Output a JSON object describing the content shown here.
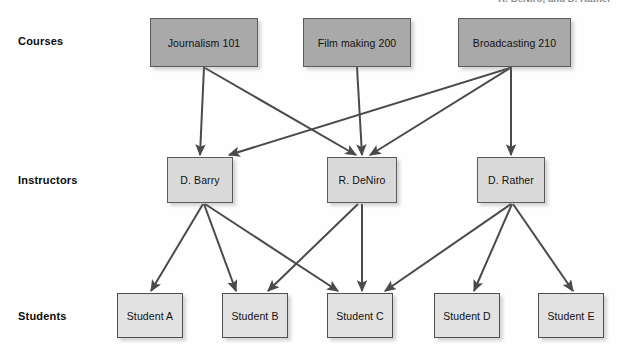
{
  "figure": {
    "top_caption": "R. DeNiro, and D. Rather",
    "type": "hierarchical-relationship-diagram",
    "background_color": "#fefefe",
    "edge_color": "#4a4a4a"
  },
  "rows": [
    {
      "label": "Courses",
      "y": 41,
      "color": "#a9a9a9"
    },
    {
      "label": "Instructors",
      "y": 180,
      "color": "#d9d9d9"
    },
    {
      "label": "Students",
      "y": 316,
      "color": "#e2e2e2"
    }
  ],
  "nodes": {
    "courses": [
      {
        "id": "journalism101",
        "label": "Journalism 101",
        "x": 150,
        "y": 18,
        "w": 108,
        "h": 49
      },
      {
        "id": "filmmaking200",
        "label": "Film making 200",
        "x": 303,
        "y": 18,
        "w": 108,
        "h": 49
      },
      {
        "id": "broadcasting210",
        "label": "Broadcasting 210",
        "x": 458,
        "y": 18,
        "w": 113,
        "h": 49
      }
    ],
    "instructors": [
      {
        "id": "dbarry",
        "label": "D. Barry",
        "x": 167,
        "y": 157,
        "w": 66,
        "h": 46
      },
      {
        "id": "rdeniro",
        "label": "R. DeNiro",
        "x": 327,
        "y": 157,
        "w": 70,
        "h": 46
      },
      {
        "id": "drather",
        "label": "D. Rather",
        "x": 477,
        "y": 157,
        "w": 68,
        "h": 46
      }
    ],
    "students": [
      {
        "id": "studentA",
        "label": "Student A",
        "x": 117,
        "y": 293,
        "w": 66,
        "h": 45
      },
      {
        "id": "studentB",
        "label": "Student B",
        "x": 222,
        "y": 293,
        "w": 66,
        "h": 45
      },
      {
        "id": "studentC",
        "label": "Student C",
        "x": 327,
        "y": 293,
        "w": 66,
        "h": 45
      },
      {
        "id": "studentD",
        "label": "Student D",
        "x": 434,
        "y": 293,
        "w": 66,
        "h": 45
      },
      {
        "id": "studentE",
        "label": "Student E",
        "x": 538,
        "y": 293,
        "w": 66,
        "h": 45
      }
    ]
  },
  "edges": [
    {
      "from": "journalism101",
      "to": "dbarry",
      "x1": 204,
      "y1": 67,
      "x2": 200,
      "y2": 155
    },
    {
      "from": "journalism101",
      "to": "rdeniro",
      "x1": 205,
      "y1": 68,
      "x2": 356,
      "y2": 155
    },
    {
      "from": "filmmaking200",
      "to": "rdeniro",
      "x1": 357,
      "y1": 67,
      "x2": 362,
      "y2": 155
    },
    {
      "from": "broadcasting210",
      "to": "dbarry",
      "x1": 510,
      "y1": 68,
      "x2": 229,
      "y2": 155
    },
    {
      "from": "broadcasting210",
      "to": "rdeniro",
      "x1": 510,
      "y1": 68,
      "x2": 370,
      "y2": 155
    },
    {
      "from": "broadcasting210",
      "to": "drather",
      "x1": 511,
      "y1": 67,
      "x2": 511,
      "y2": 155
    },
    {
      "from": "dbarry",
      "to": "studentA",
      "x1": 203,
      "y1": 204,
      "x2": 151,
      "y2": 291
    },
    {
      "from": "dbarry",
      "to": "studentB",
      "x1": 204,
      "y1": 204,
      "x2": 236,
      "y2": 291
    },
    {
      "from": "dbarry",
      "to": "studentC",
      "x1": 205,
      "y1": 204,
      "x2": 338,
      "y2": 291
    },
    {
      "from": "rdeniro",
      "to": "studentB",
      "x1": 358,
      "y1": 204,
      "x2": 268,
      "y2": 291
    },
    {
      "from": "rdeniro",
      "to": "studentC",
      "x1": 362,
      "y1": 204,
      "x2": 362,
      "y2": 291
    },
    {
      "from": "drather",
      "to": "studentC",
      "x1": 511,
      "y1": 204,
      "x2": 385,
      "y2": 291
    },
    {
      "from": "drather",
      "to": "studentD",
      "x1": 512,
      "y1": 204,
      "x2": 474,
      "y2": 291
    },
    {
      "from": "drather",
      "to": "studentE",
      "x1": 513,
      "y1": 204,
      "x2": 573,
      "y2": 291
    }
  ]
}
